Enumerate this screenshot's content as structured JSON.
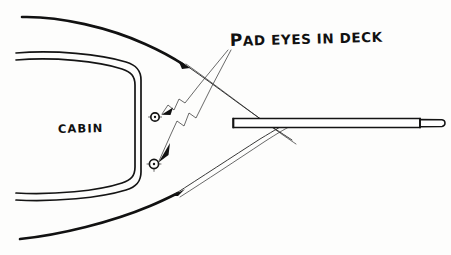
{
  "document": {
    "kind": "hand-drawn-sketch",
    "title": "Pad eyes in deck - boat bow deck plan",
    "ink_color": "#111111",
    "paper_color": "#fdfdfc",
    "width": 451,
    "height": 255
  },
  "labels": {
    "callout": {
      "text": "PAD EYES IN DECK",
      "lead_cap": "P",
      "rest": "AD EYES IN DECK",
      "x": 228,
      "y": 46
    },
    "cabin": {
      "text": "CABIN",
      "x": 58,
      "y": 133
    }
  },
  "parts": {
    "hull": {
      "name": "hull-outline",
      "description": "Two long curved deck edges converging at the bow on the right"
    },
    "cabin_outline": {
      "name": "cabin-outline",
      "description": "Double-line U-shaped cabin trunk opening to the left"
    },
    "spar": {
      "name": "bowsprit-spar",
      "description": "Long horizontal tapered spar extending right past the bow",
      "x": 233,
      "y": 123,
      "length": 215,
      "thickness": 9,
      "end_cap_x": 426
    },
    "pad_eyes": [
      {
        "name": "pad-eye-upper",
        "label": "PAD EYES IN DECK",
        "cx": 155,
        "cy": 117,
        "r": 4.2
      },
      {
        "name": "pad-eye-lower",
        "label": "PAD EYES IN DECK",
        "cx": 154,
        "cy": 164,
        "r": 4.6
      }
    ],
    "leader_lines": [
      {
        "name": "leader-line-upper",
        "from_x": 228,
        "from_y": 50,
        "to_x": 160,
        "to_y": 116
      },
      {
        "name": "leader-line-lower",
        "from_x": 231,
        "from_y": 50,
        "to_x": 159,
        "to_y": 163
      }
    ]
  }
}
